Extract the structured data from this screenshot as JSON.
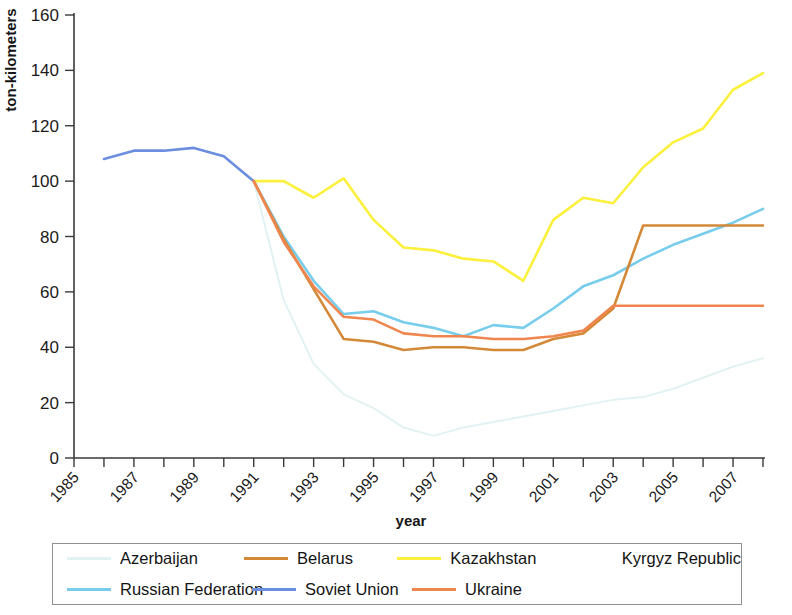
{
  "chart_data": {
    "type": "line",
    "title": "",
    "xlabel": "year",
    "ylabel": "ton-kilometers",
    "xlim": [
      1985,
      2008
    ],
    "ylim": [
      0,
      160
    ],
    "ytick_values": [
      0,
      20,
      40,
      60,
      80,
      100,
      120,
      140,
      160
    ],
    "ytick_labels": [
      "0",
      "20",
      "40",
      "60",
      "80",
      "100",
      "120",
      "140",
      "160"
    ],
    "xtick_values": [
      1985,
      1987,
      1989,
      1991,
      1993,
      1995,
      1997,
      1999,
      2001,
      2003,
      2005,
      2007
    ],
    "xtick_labels": [
      "1985",
      "1987",
      "1989",
      "1991",
      "1993",
      "1995",
      "1997",
      "1999",
      "2001",
      "2003",
      "2005",
      "2007"
    ],
    "minor_xticks_every": 1,
    "grid": false,
    "legend_position": "bottom",
    "series": [
      {
        "name": "Azerbaijan",
        "color": "#e2f2f2",
        "x": [
          1991,
          1992,
          1993,
          1994,
          1995,
          1996,
          1997,
          1998,
          1999,
          2000,
          2001,
          2002,
          2003,
          2004,
          2005,
          2006,
          2007,
          2008
        ],
        "values": [
          100,
          57,
          34,
          23,
          18,
          11,
          8,
          11,
          13,
          15,
          17,
          19,
          21,
          22,
          25,
          29,
          33,
          36
        ]
      },
      {
        "name": "Belarus",
        "color": "#d38938",
        "x": [
          1991,
          1992,
          1993,
          1994,
          1995,
          1996,
          1997,
          1998,
          1999,
          2000,
          2001,
          2002,
          2003,
          2004,
          2005,
          2006,
          2007,
          2008
        ],
        "values": [
          100,
          79,
          61,
          43,
          42,
          39,
          40,
          40,
          39,
          39,
          43,
          45,
          54,
          84,
          84,
          84,
          84,
          84
        ]
      },
      {
        "name": "Kazakhstan",
        "color": "#fbf03c",
        "x": [
          1991,
          1992,
          1993,
          1994,
          1995,
          1996,
          1997,
          1998,
          1999,
          2000,
          2001,
          2002,
          2003,
          2004,
          2005,
          2006,
          2007,
          2008
        ],
        "values": [
          100,
          100,
          94,
          101,
          86,
          76,
          75,
          72,
          71,
          64,
          86,
          94,
          92,
          105,
          114,
          119,
          133,
          139
        ]
      },
      {
        "name": "Kyrgyz Republic",
        "color": "#ffffff",
        "x": [],
        "values": []
      },
      {
        "name": "Russian Federation",
        "color": "#78cdec",
        "x": [
          1991,
          1992,
          1993,
          1994,
          1995,
          1996,
          1997,
          1998,
          1999,
          2000,
          2001,
          2002,
          2003,
          2004,
          2005,
          2006,
          2007,
          2008
        ],
        "values": [
          100,
          80,
          64,
          52,
          53,
          49,
          47,
          44,
          48,
          47,
          54,
          62,
          66,
          72,
          77,
          81,
          85,
          90
        ]
      },
      {
        "name": "Soviet Union",
        "color": "#6b8ee0",
        "x": [
          1986,
          1987,
          1988,
          1989,
          1990,
          1991
        ],
        "values": [
          108,
          111,
          111,
          112,
          109,
          100
        ]
      },
      {
        "name": "Ukraine",
        "color": "#f0864f",
        "x": [
          1991,
          1992,
          1993,
          1994,
          1995,
          1996,
          1997,
          1998,
          1999,
          2000,
          2001,
          2002,
          2003,
          2004,
          2005,
          2006,
          2007,
          2008
        ],
        "values": [
          100,
          78,
          62,
          51,
          50,
          45,
          44,
          44,
          43,
          43,
          44,
          46,
          55,
          55,
          55,
          55,
          55,
          55
        ]
      }
    ]
  },
  "axes": {
    "ylabel": "ton-kilometers",
    "xlabel": "year"
  },
  "legend": {
    "entries": [
      {
        "label": "Azerbaijan",
        "color": "#e2f2f2"
      },
      {
        "label": "Belarus",
        "color": "#d38938"
      },
      {
        "label": "Kazakhstan",
        "color": "#fbf03c"
      },
      {
        "label": "Kyrgyz Republic",
        "color": "#ffffff"
      },
      {
        "label": "Russian Federation",
        "color": "#78cdec"
      },
      {
        "label": "Soviet Union",
        "color": "#6b8ee0"
      },
      {
        "label": "Ukraine",
        "color": "#f0864f"
      }
    ]
  }
}
